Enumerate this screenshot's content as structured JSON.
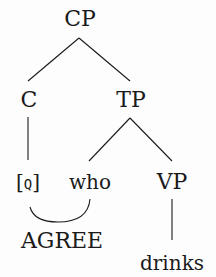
{
  "tree": {
    "root": {
      "label": "CP",
      "x": 80,
      "y": 19
    },
    "c": {
      "label": "C",
      "x": 29,
      "y": 100
    },
    "tp": {
      "label": "TP",
      "x": 131,
      "y": 100
    },
    "q": {
      "label": "[Q]",
      "open": "[",
      "inner": "Q",
      "close": "]",
      "x": 28,
      "y": 182
    },
    "who": {
      "label": "who",
      "x": 90,
      "y": 182
    },
    "vp": {
      "label": "VP",
      "x": 172,
      "y": 182
    },
    "agree": {
      "label": "AGREE",
      "x": 62,
      "y": 241
    },
    "drinks": {
      "label": "drinks",
      "x": 172,
      "y": 263
    }
  },
  "edges": [
    {
      "from": "CP",
      "to": "C"
    },
    {
      "from": "CP",
      "to": "TP"
    },
    {
      "from": "C",
      "to": "[Q]"
    },
    {
      "from": "TP",
      "to": "who"
    },
    {
      "from": "TP",
      "to": "VP"
    },
    {
      "from": "VP",
      "to": "drinks"
    }
  ],
  "relation": {
    "label": "AGREE",
    "between": [
      "[Q]",
      "who"
    ],
    "style": "arc"
  },
  "colors": {
    "ink": "#1a1a1a",
    "background": "#fdfdfd"
  }
}
